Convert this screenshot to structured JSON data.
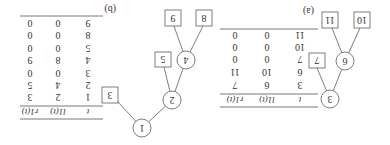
{
  "orientation": "rotated-180",
  "panels": [
    {
      "label": "(a)",
      "tree": {
        "internal_nodes": [
          "3",
          "6"
        ],
        "leaves": [
          "7",
          "10",
          "11"
        ],
        "edges": [
          [
            "3",
            "6"
          ],
          [
            "3",
            "7"
          ],
          [
            "6",
            "10"
          ],
          [
            "6",
            "11"
          ]
        ]
      },
      "table": {
        "headers": [
          "t",
          "l1(t)",
          "r1(t)"
        ],
        "rows": [
          [
            "3",
            "6",
            "7"
          ],
          [
            "6",
            "10",
            "11"
          ],
          [
            "7",
            "0",
            "0"
          ],
          [
            "10",
            "0",
            "0"
          ],
          [
            "11",
            "0",
            "0"
          ]
        ]
      }
    },
    {
      "label": "(b)",
      "tree": {
        "internal_nodes": [
          "1",
          "2",
          "4"
        ],
        "leaves": [
          "3",
          "5",
          "8",
          "9"
        ],
        "edges": [
          [
            "1",
            "2"
          ],
          [
            "1",
            "3"
          ],
          [
            "2",
            "4"
          ],
          [
            "2",
            "5"
          ],
          [
            "4",
            "8"
          ],
          [
            "4",
            "9"
          ]
        ]
      },
      "table": {
        "headers": [
          "t",
          "l1(t)",
          "r1(t)"
        ],
        "rows": [
          [
            "1",
            "2",
            "3"
          ],
          [
            "2",
            "4",
            "5"
          ],
          [
            "3",
            "0",
            "0"
          ],
          [
            "4",
            "8",
            "9"
          ],
          [
            "5",
            "0",
            "0"
          ],
          [
            "8",
            "0",
            "0"
          ],
          [
            "9",
            "0",
            "0"
          ]
        ]
      }
    }
  ]
}
